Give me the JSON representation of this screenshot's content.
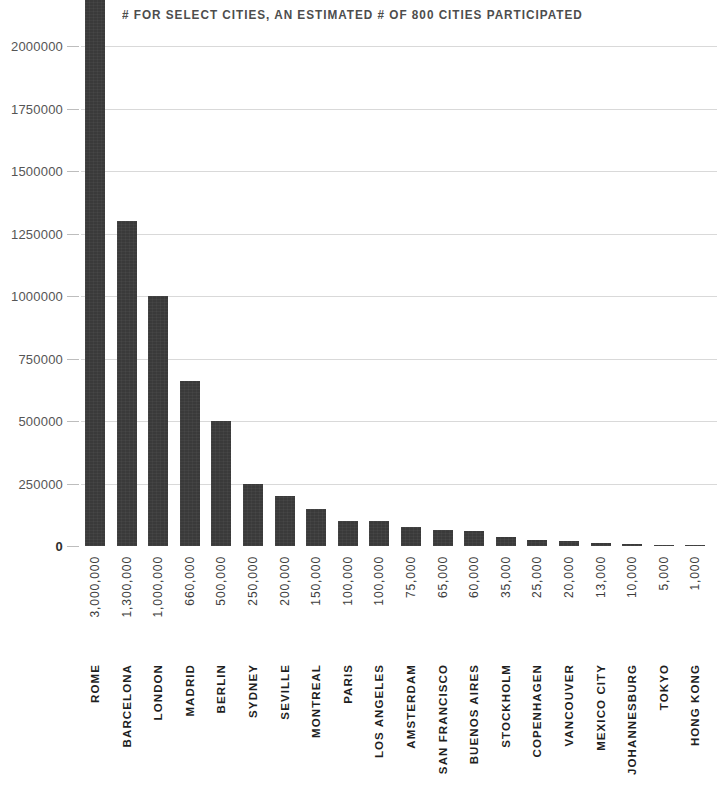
{
  "chart_data": {
    "type": "bar",
    "title": "# FOR SELECT CITIES, AN ESTIMATED # OF 800 CITIES PARTICIPATED",
    "xlabel": "",
    "ylabel": "",
    "ylim": [
      0,
      2000000
    ],
    "grid": true,
    "legend": "none",
    "note": "First bar (Rome, 3,000,000) exceeds the plotted axis maximum and is clipped at the top of the frame.",
    "y_ticks": [
      "2000000",
      "1750000",
      "1500000",
      "1250000",
      "1000000",
      "750000",
      "500000",
      "250000",
      "0"
    ],
    "y_tick_values": [
      2000000,
      1750000,
      1500000,
      1250000,
      1000000,
      750000,
      500000,
      250000,
      0
    ],
    "categories": [
      "ROME",
      "BARCELONA",
      "LONDON",
      "MADRID",
      "BERLIN",
      "SYDNEY",
      "SEVILLE",
      "MONTREAL",
      "PARIS",
      "LOS ANGELES",
      "AMSTERDAM",
      "SAN FRANCISCO",
      "BUENOS AIRES",
      "STOCKHOLM",
      "COPENHAGEN",
      "VANCOUVER",
      "MEXICO CITY",
      "JOHANNESBURG",
      "TOKYO",
      "HONG KONG"
    ],
    "values": [
      3000000,
      1300000,
      1000000,
      660000,
      500000,
      250000,
      200000,
      150000,
      100000,
      100000,
      75000,
      65000,
      60000,
      35000,
      25000,
      20000,
      13000,
      10000,
      5000,
      1000
    ],
    "value_labels": [
      "3,000,000",
      "1,300,000",
      "1,000,000",
      "660,000",
      "500,000",
      "250,000",
      "200,000",
      "150,000",
      "100,000",
      "100,000",
      "75,000",
      "65,000",
      "60,000",
      "35,000",
      "25,000",
      "20,000",
      "13,000",
      "10,000",
      "5,000",
      "1,000"
    ]
  },
  "colors": {
    "bar": "#3a3a3a",
    "gridline": "#d9d9d9",
    "baseline": "#8a8a8a",
    "title_text": "#4d4d4d",
    "axis_text": "#555555",
    "category_text": "#1f1f1f",
    "background": "#ffffff"
  }
}
